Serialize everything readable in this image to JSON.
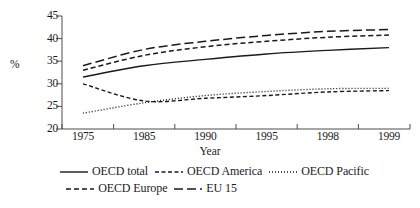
{
  "chart_data": {
    "type": "line",
    "title": "",
    "xlabel": "Year",
    "ylabel": "%",
    "categories": [
      "1975",
      "1985",
      "1990",
      "1995",
      "1998",
      "1999"
    ],
    "ylim": [
      20,
      45
    ],
    "yticks": [
      20,
      25,
      30,
      35,
      40,
      45
    ],
    "grid": false,
    "legend_position": "bottom",
    "series": [
      {
        "name": "OECD total",
        "style": "solid",
        "color": "#1a1a1a",
        "values": [
          31.5,
          34.0,
          35.4,
          36.6,
          37.4,
          38.0
        ]
      },
      {
        "name": "OECD America",
        "style": "dash-dot",
        "color": "#1a1a1a",
        "values": [
          30.0,
          26.2,
          26.8,
          27.4,
          28.2,
          28.5
        ]
      },
      {
        "name": "OECD Pacific",
        "style": "dotted",
        "color": "#1a1a1a",
        "values": [
          23.5,
          25.8,
          27.4,
          28.3,
          28.9,
          29.0
        ]
      },
      {
        "name": "OECD Europe",
        "style": "dashed",
        "color": "#1a1a1a",
        "values": [
          33.0,
          36.3,
          38.2,
          39.4,
          40.3,
          40.8
        ]
      },
      {
        "name": "EU 15",
        "style": "long-dash",
        "color": "#1a1a1a",
        "values": [
          34.0,
          37.6,
          39.4,
          40.7,
          41.6,
          42.0
        ]
      }
    ]
  },
  "legend": {
    "row1": [
      "OECD total",
      "OECD America",
      "OECD Pacific"
    ],
    "row2": [
      "OECD Europe",
      "EU 15"
    ]
  }
}
